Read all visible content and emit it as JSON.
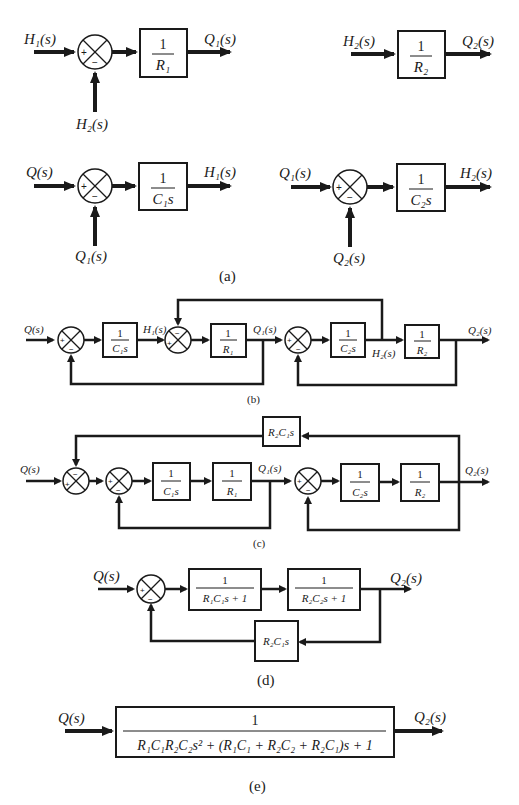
{
  "figure": {
    "panels": {
      "a": {
        "caption": "(a)",
        "blocks": [
          {
            "input": "H₁(s)",
            "minus_input": "H₂(s)",
            "plus": "+",
            "minus": "−",
            "num": "1",
            "den": "R₁",
            "output": "Q₁(s)"
          },
          {
            "input": "H₂(s)",
            "num": "1",
            "den": "R₂",
            "output": "Q₂(s)"
          },
          {
            "input": "Q(s)",
            "minus_input": "Q₁(s)",
            "plus": "+",
            "minus": "−",
            "num": "1",
            "den": "C₁s",
            "output": "H₁(s)"
          },
          {
            "input": "Q₁(s)",
            "minus_input": "Q₂(s)",
            "plus": "+",
            "minus": "−",
            "num": "1",
            "den": "C₂s",
            "output": "H₂(s)"
          }
        ]
      },
      "b": {
        "caption": "(b)",
        "input": "Q(s)",
        "signals": {
          "h1": "H₁(s)",
          "q1": "Q₁(s)",
          "h2": "H₂(s)",
          "q2": "Q₂(s)"
        },
        "blocks": [
          {
            "num": "1",
            "den": "C₁s"
          },
          {
            "num": "1",
            "den": "R₁"
          },
          {
            "num": "1",
            "den": "C₂s"
          },
          {
            "num": "1",
            "den": "R₂"
          }
        ],
        "signs": {
          "plus": "+",
          "minus": "−"
        }
      },
      "c": {
        "caption": "(c)",
        "input": "Q(s)",
        "signals": {
          "q1": "Q₁(s)",
          "q2": "Q₂(s)"
        },
        "feedback_block": "R₂C₁s",
        "blocks": [
          {
            "num": "1",
            "den": "C₁s"
          },
          {
            "num": "1",
            "den": "R₁"
          },
          {
            "num": "1",
            "den": "C₂s"
          },
          {
            "num": "1",
            "den": "R₂"
          }
        ],
        "signs": {
          "plus": "+",
          "minus": "−"
        }
      },
      "d": {
        "caption": "(d)",
        "input": "Q(s)",
        "output": "Q₂(s)",
        "blocks": [
          {
            "num": "1",
            "den": "R₁C₁s + 1"
          },
          {
            "num": "1",
            "den": "R₂C₂s + 1"
          }
        ],
        "feedback_block": "R₂C₁s",
        "signs": {
          "plus": "+",
          "minus": "−"
        }
      },
      "e": {
        "caption": "(e)",
        "input": "Q(s)",
        "output": "Q₂(s)",
        "num": "1",
        "den": "R₁C₁R₂C₂s² + (R₁C₁ + R₂C₂ + R₂C₁)s + 1"
      }
    }
  }
}
